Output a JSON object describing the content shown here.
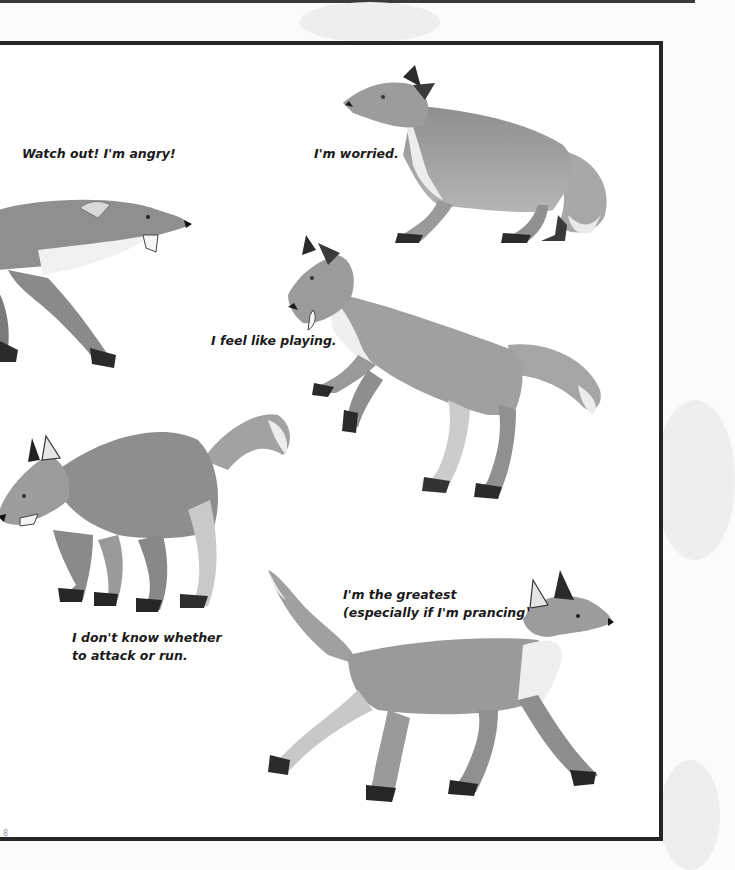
{
  "page": {
    "number": "8",
    "colors": {
      "frame_border": "#262626",
      "page_background": "#ffffff",
      "outside_background": "#fbfbfb",
      "caption_text": "#1a1a1a",
      "fur_mid": "#9a9a9a",
      "fur_dark": "#6e6e6e",
      "paws": "#2b2b2b",
      "chest": "#f2f2f2"
    }
  },
  "illustrations": [
    {
      "id": "angry-fox",
      "caption": [
        "Watch out! I'm angry!"
      ],
      "pose": "snarling, head forward, mouth open"
    },
    {
      "id": "worried-fox",
      "caption": [
        "I'm worried."
      ],
      "pose": "crouched low, ears back, tail tucked"
    },
    {
      "id": "playing-fox",
      "caption": [
        "I feel like playing."
      ],
      "pose": "front paws raised, play bow"
    },
    {
      "id": "unsure-fox",
      "caption": [
        "I don't know whether",
        "to attack or run."
      ],
      "pose": "arched back, head low, tail up"
    },
    {
      "id": "greatest-fox",
      "caption": [
        "I'm the greatest",
        "(especially if I'm prancing)."
      ],
      "pose": "prancing, head and tail high"
    }
  ]
}
